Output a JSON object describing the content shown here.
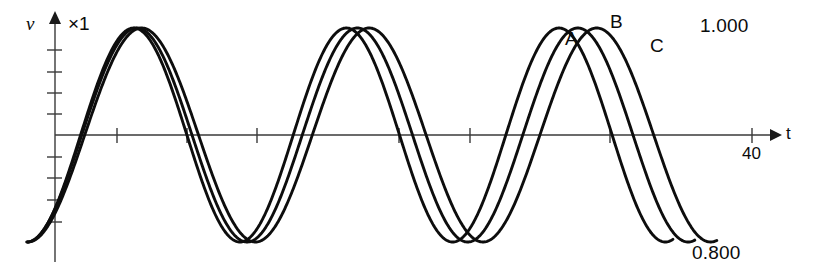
{
  "figure": {
    "background_color": "#ffffff",
    "line_color": "#0d0d0d",
    "axis_color": "#3a3a3a",
    "y_axis_label": "v",
    "y_scale_label": "×1",
    "x_axis_label": "t",
    "x_tick_label": "40",
    "top_right_value": "1.000",
    "bottom_right_value": "0.800",
    "curve_labels": [
      "A",
      "B",
      "C"
    ]
  },
  "chart_data": {
    "type": "line",
    "title": "",
    "xlabel": "t",
    "ylabel": "v",
    "y_scale": "×1",
    "grid": false,
    "legend": "inline-annotations",
    "x_axis": {
      "range": [
        0,
        44
      ],
      "labeled_ticks": [
        {
          "value": 40,
          "label": "40"
        }
      ],
      "tick_values": [
        5,
        10,
        15,
        25,
        30,
        35,
        40
      ],
      "arrow_end": true
    },
    "y_axis": {
      "range": [
        -1.05,
        1.05
      ],
      "tick_values": [
        -0.8,
        -0.6,
        -0.4,
        -0.2,
        0.2,
        0.4,
        0.6,
        0.8
      ],
      "arrow_end": true,
      "annotations": [
        {
          "label": "1.000",
          "position": "top-right"
        },
        {
          "label": "0.800",
          "position": "bottom-right"
        }
      ]
    },
    "series": [
      {
        "name": "A",
        "label_at": {
          "x": 33.0,
          "y": 0.86
        },
        "amplitude": 1.0,
        "frequency_rel": 1.0,
        "peaks": [
          {
            "x": 5.0,
            "y": 1.0
          },
          {
            "x": 18.5,
            "y": 1.0
          },
          {
            "x": 32.0,
            "y": 1.0
          }
        ],
        "troughs": [
          {
            "x": 11.8,
            "y": -1.0
          },
          {
            "x": 25.3,
            "y": -1.0
          },
          {
            "x": 38.7,
            "y": -1.0
          }
        ]
      },
      {
        "name": "B",
        "label_at": {
          "x": 35.5,
          "y": 1.02
        },
        "amplitude": 1.0,
        "frequency_rel": 0.97,
        "peaks": [
          {
            "x": 5.2,
            "y": 1.0
          },
          {
            "x": 19.1,
            "y": 1.0
          },
          {
            "x": 33.2,
            "y": 1.0
          }
        ],
        "troughs": [
          {
            "x": 12.1,
            "y": -1.0
          },
          {
            "x": 26.1,
            "y": -1.0
          },
          {
            "x": 40.1,
            "y": -1.0
          }
        ]
      },
      {
        "name": "C",
        "label_at": {
          "x": 37.8,
          "y": 0.8
        },
        "amplitude": 1.0,
        "frequency_rel": 0.94,
        "peaks": [
          {
            "x": 5.5,
            "y": 1.0
          },
          {
            "x": 19.8,
            "y": 1.0
          },
          {
            "x": 34.4,
            "y": 1.0
          }
        ],
        "troughs": [
          {
            "x": 12.5,
            "y": -1.0
          },
          {
            "x": 27.0,
            "y": -1.0
          },
          {
            "x": 41.5,
            "y": -1.0
          }
        ]
      }
    ]
  }
}
